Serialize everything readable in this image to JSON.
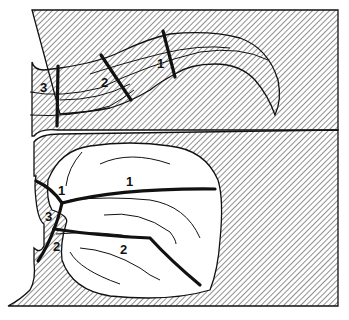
{
  "diagram": {
    "colors": {
      "ink": "#111111",
      "background": "#ffffff",
      "hatch": "#222222"
    },
    "upper_panel": {
      "description": "curved channel (fissure) with three numbered cross-section cuts",
      "labels": [
        "1",
        "2",
        "3"
      ]
    },
    "lower_panel": {
      "description": "basin with branching cut lines numbered",
      "labels": [
        "1",
        "1",
        "3",
        "2",
        "2"
      ]
    }
  }
}
